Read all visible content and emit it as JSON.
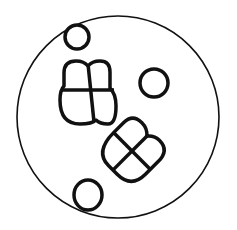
{
  "diagram": {
    "type": "microscope-field-of-view",
    "background": "#ffffff",
    "stroke_color": "#111111",
    "field": {
      "cx": 118,
      "cy": 117,
      "r": 101
    },
    "single_cells": [
      {
        "name": "cell-top-left",
        "cx": 77,
        "cy": 37,
        "rx": 12,
        "ry": 12
      },
      {
        "name": "cell-right",
        "cx": 154,
        "cy": 83,
        "rx": 14,
        "ry": 14
      },
      {
        "name": "cell-bottom-left",
        "cx": 88,
        "cy": 195,
        "rx": 14,
        "ry": 15
      }
    ],
    "clusters": [
      {
        "name": "tetrad-upper-left",
        "cx": 88,
        "cy": 92,
        "cell_count": 4,
        "rotation": 0
      },
      {
        "name": "tetrad-lower-right",
        "cx": 132,
        "cy": 151,
        "cell_count": 4,
        "rotation": 45
      }
    ]
  }
}
